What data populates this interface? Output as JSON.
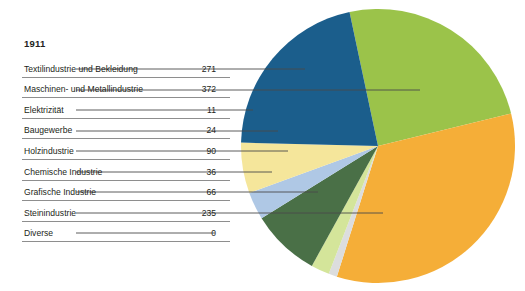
{
  "year_label": "1911",
  "table": {
    "columns": [
      "Branche",
      "Anzahl"
    ],
    "rows": [
      {
        "label": "Textilindustrie und Bekleidung",
        "value": "271"
      },
      {
        "label": "Maschinen- und Metallindustrie",
        "value": "372"
      },
      {
        "label": "Elektrizität",
        "value": "11"
      },
      {
        "label": "Baugewerbe",
        "value": "24"
      },
      {
        "label": "Holzindustrie",
        "value": "90"
      },
      {
        "label": "Chemische Industrie",
        "value": "36"
      },
      {
        "label": "Grafische Industrie",
        "value": "66"
      },
      {
        "label": "Steinindustrie",
        "value": "235"
      },
      {
        "label": "Diverse",
        "value": "0"
      }
    ]
  },
  "chart_data": {
    "type": "pie",
    "title": "1911",
    "categories": [
      "Textilindustrie und Bekleidung",
      "Maschinen- und Metallindustrie",
      "Elektrizität",
      "Baugewerbe",
      "Holzindustrie",
      "Chemische Industrie",
      "Grafische Industrie",
      "Steinindustrie",
      "Diverse"
    ],
    "values": [
      271,
      372,
      11,
      24,
      90,
      36,
      66,
      235,
      0
    ],
    "total": 1105,
    "unit": "",
    "xlabel": "",
    "ylabel": "",
    "legend": "none",
    "grid": false,
    "start_angle_deg": -12,
    "direction": "clockwise",
    "colors": [
      "#9BC34A",
      "#F5AE38",
      "#DCDDDD",
      "#D4E59A",
      "#4A7047",
      "#AFC8E5",
      "#F5E69B",
      "#1B5E8C",
      "#FFFFFF"
    ],
    "slice_order_clockwise_from_top": [
      "Textilindustrie und Bekleidung",
      "Maschinen- und Metallindustrie",
      "Elektrizität",
      "Baugewerbe",
      "Holzindustrie",
      "Chemische Industrie",
      "Grafische Industrie",
      "Steinindustrie",
      "Diverse"
    ]
  },
  "geometry": {
    "cx": 378,
    "cy": 146,
    "r": 137
  },
  "leader_lines": [
    {
      "from_row": 0,
      "y": 69,
      "x1": 76,
      "x2": 305
    },
    {
      "from_row": 1,
      "y": 90,
      "x1": 76,
      "x2": 420
    },
    {
      "from_row": 2,
      "y": 110,
      "x1": 76,
      "x2": 253
    },
    {
      "from_row": 3,
      "y": 131,
      "x1": 76,
      "x2": 278
    },
    {
      "from_row": 4,
      "y": 151,
      "x1": 76,
      "x2": 288
    },
    {
      "from_row": 5,
      "y": 172,
      "x1": 76,
      "x2": 272
    },
    {
      "from_row": 6,
      "y": 192,
      "x1": 76,
      "x2": 318
    },
    {
      "from_row": 7,
      "y": 213,
      "x1": 76,
      "x2": 383
    },
    {
      "from_row": 8,
      "y": 233,
      "x1": 76,
      "x2": 215
    }
  ]
}
